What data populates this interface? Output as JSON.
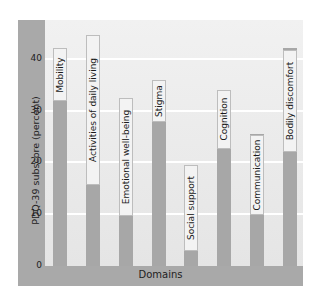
{
  "chart_data": {
    "type": "bar",
    "title": "",
    "xlabel": "Domains",
    "ylabel": "PDQ-39 subscore (percent)",
    "ylim": [
      0,
      45
    ],
    "yticks": [
      0,
      10,
      20,
      30,
      40
    ],
    "grid": true,
    "legend": null,
    "categories": [
      "Mobility",
      "Activities of daily living",
      "Emotional well-being",
      "Stigma",
      "Social support",
      "Cognition",
      "Communication",
      "Bodily discomfort"
    ],
    "values": [
      42,
      44.5,
      32.5,
      36,
      7.5,
      34,
      25.5,
      42
    ],
    "label_tops": [
      48,
      35,
      98,
      80,
      165,
      90,
      135,
      50
    ]
  },
  "axis": {
    "y_title": "PDQ-39 subscore (percent)",
    "x_title": "Domains",
    "ticks": [
      "0",
      "10",
      "20",
      "30",
      "40"
    ]
  },
  "colors": {
    "bar": "#a7a7a7",
    "axis_strip": "#a9a9a9",
    "panel": "#ececec",
    "gridline": "#ffffff"
  }
}
